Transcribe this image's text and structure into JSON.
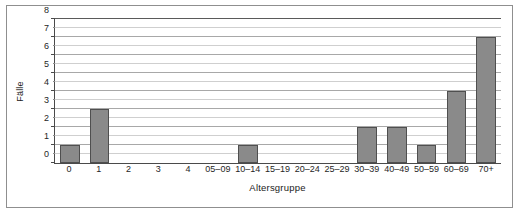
{
  "chart_data": {
    "type": "bar",
    "title": "",
    "subtitle": "",
    "xlabel": "Altersgruppe",
    "ylabel": "Fälle",
    "categories": [
      "0",
      "1",
      "2",
      "3",
      "4",
      "05–09",
      "10–14",
      "15–19",
      "20–24",
      "25–29",
      "30–39",
      "40–49",
      "50–59",
      "60–69",
      "70+"
    ],
    "values": [
      1,
      3,
      0,
      0,
      0,
      0,
      1,
      0,
      0,
      0,
      2,
      2,
      1,
      4,
      7
    ],
    "ylim": [
      0,
      8
    ],
    "ytick_values": [
      0,
      1,
      2,
      3,
      4,
      5,
      6,
      7,
      8
    ],
    "ytick_labels": [
      "0",
      "1",
      "2",
      "3",
      "4",
      "5",
      "6",
      "7",
      "8"
    ],
    "minor_tick_step": 0.5,
    "grid": "horizontal",
    "legend": "none",
    "series": [
      {
        "name": "Fälle",
        "values": [
          1,
          3,
          0,
          0,
          0,
          0,
          1,
          0,
          0,
          0,
          2,
          2,
          1,
          4,
          7
        ]
      }
    ],
    "colors": {
      "bar_fill": "#8a8a8a",
      "bar_border": "#4f4f4f",
      "gridline": "#cfcfcf",
      "gridline_major": "#a8a8a8",
      "axis": "#4a4a4a",
      "frame": "#8f8f8f",
      "background": "#ffffff",
      "text": "#262626"
    }
  }
}
